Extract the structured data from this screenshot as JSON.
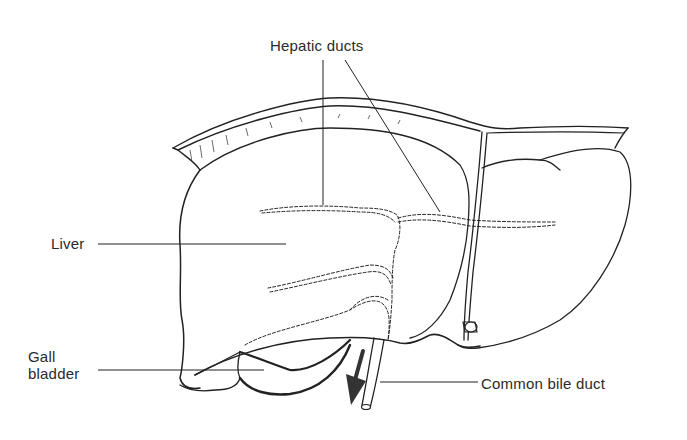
{
  "figure": {
    "type": "anatomical line drawing",
    "labels": [
      {
        "id": "hepatic_ducts",
        "text": "Hepatic ducts"
      },
      {
        "id": "liver",
        "text": "Liver"
      },
      {
        "id": "gall_bladder",
        "text": "Gall\nbladder",
        "lines": [
          "Gall",
          "bladder"
        ]
      },
      {
        "id": "common_bile_duct",
        "text": "Common bile duct"
      }
    ],
    "annotations": {
      "arrow": "downward arrow beside common bile duct indicating bile flow direction"
    },
    "colors": {
      "ink": "#222222",
      "background": "#ffffff",
      "text": "#2a2a2a"
    }
  }
}
